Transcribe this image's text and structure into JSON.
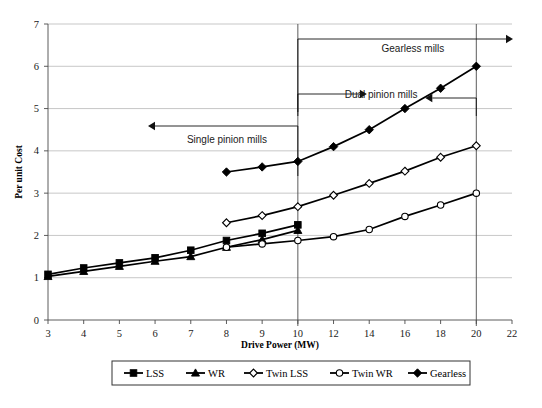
{
  "chart_data": {
    "type": "line",
    "title": "",
    "xlabel": "Drive Power (MW)",
    "ylabel": "Per unit Cost",
    "categories": [
      3,
      4,
      5,
      6,
      7,
      8,
      9,
      10,
      12,
      14,
      16,
      18,
      20,
      22
    ],
    "xtick_labels": [
      "3",
      "4",
      "5",
      "6",
      "7",
      "8",
      "9",
      "10",
      "12",
      "14",
      "16",
      "18",
      "20",
      "22"
    ],
    "ytick_labels": [
      "0",
      "1",
      "2",
      "3",
      "4",
      "5",
      "6",
      "7"
    ],
    "ylim": [
      0,
      7
    ],
    "grid": true,
    "legend_position": "bottom",
    "series": [
      {
        "name": "LSS",
        "marker": "filled-square",
        "x": [
          3,
          4,
          5,
          6,
          7,
          8,
          9,
          10
        ],
        "values": [
          1.08,
          1.23,
          1.35,
          1.47,
          1.65,
          1.88,
          2.05,
          2.25
        ]
      },
      {
        "name": "WR",
        "marker": "filled-triangle",
        "x": [
          3,
          4,
          5,
          6,
          7,
          8,
          9,
          10
        ],
        "values": [
          1.03,
          1.15,
          1.27,
          1.39,
          1.5,
          1.72,
          1.9,
          2.12
        ]
      },
      {
        "name": "Twin LSS",
        "marker": "open-diamond",
        "x": [
          8,
          9,
          10,
          12,
          14,
          16,
          18,
          20
        ],
        "values": [
          2.3,
          2.47,
          2.68,
          2.95,
          3.23,
          3.52,
          3.85,
          4.12
        ]
      },
      {
        "name": "Twin WR",
        "marker": "open-circle",
        "x": [
          8,
          9,
          10,
          12,
          14,
          16,
          18,
          20
        ],
        "values": [
          1.72,
          1.8,
          1.88,
          1.97,
          2.14,
          2.45,
          2.72,
          3.0
        ]
      },
      {
        "name": "Gearless",
        "marker": "filled-diamond",
        "x": [
          8,
          9,
          10,
          12,
          14,
          16,
          18,
          20
        ],
        "values": [
          3.5,
          3.62,
          3.75,
          4.1,
          4.5,
          5.0,
          5.48,
          6.0
        ]
      }
    ],
    "annotations": [
      {
        "id": "gearless-mills",
        "text": "Gearless mills",
        "range_from": 10,
        "range_to": 22,
        "arrow": "right"
      },
      {
        "id": "dual-pinion-mills",
        "text": "Dual pinion mills",
        "range_from": 10,
        "range_to": 20,
        "arrow": "both"
      },
      {
        "id": "single-pinion-mills",
        "text": "Single pinion mills",
        "range_from": 3,
        "range_to": 10,
        "arrow": "left"
      }
    ]
  },
  "legend": {
    "items": [
      {
        "label": "LSS",
        "marker": "filled-square"
      },
      {
        "label": "WR",
        "marker": "filled-triangle"
      },
      {
        "label": "Twin LSS",
        "marker": "open-diamond"
      },
      {
        "label": "Twin WR",
        "marker": "open-circle"
      },
      {
        "label": "Gearless",
        "marker": "filled-diamond"
      }
    ]
  }
}
